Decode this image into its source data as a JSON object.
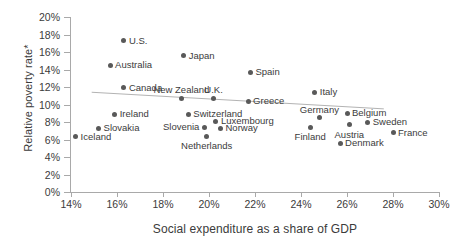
{
  "chart_data": {
    "type": "scatter",
    "title": "",
    "xlabel": "Social expenditure as a share of GDP",
    "ylabel": "Relative poverty rate*",
    "xlim": [
      14,
      30
    ],
    "ylim": [
      0,
      20
    ],
    "xticks": [
      "14%",
      "16%",
      "18%",
      "20%",
      "22%",
      "24%",
      "26%",
      "28%",
      "30%"
    ],
    "yticks": [
      "0%",
      "2%",
      "4%",
      "6%",
      "8%",
      "10%",
      "12%",
      "14%",
      "16%",
      "18%",
      "20%"
    ],
    "grid": false,
    "legend": false,
    "trendline": {
      "type": "linear",
      "x_start": 14.9,
      "y_start": 11.4,
      "x_end": 27.6,
      "y_end": 9.5
    },
    "points": [
      {
        "label": "U.S.",
        "x": 16.3,
        "y": 17.3,
        "label_pos": "right"
      },
      {
        "label": "Japan",
        "x": 18.9,
        "y": 15.6,
        "label_pos": "right"
      },
      {
        "label": "Australia",
        "x": 15.7,
        "y": 14.5,
        "label_pos": "right"
      },
      {
        "label": "Spain",
        "x": 21.8,
        "y": 13.7,
        "label_pos": "right"
      },
      {
        "label": "Canada",
        "x": 16.3,
        "y": 11.9,
        "label_pos": "right"
      },
      {
        "label": "Italy",
        "x": 24.6,
        "y": 11.4,
        "label_pos": "right"
      },
      {
        "label": "New Zealand",
        "x": 18.8,
        "y": 10.7,
        "label_pos": "above"
      },
      {
        "label": "U.K.",
        "x": 20.2,
        "y": 10.7,
        "label_pos": "above"
      },
      {
        "label": "Greece",
        "x": 21.7,
        "y": 10.4,
        "label_pos": "right"
      },
      {
        "label": "Switzerland",
        "x": 19.1,
        "y": 8.9,
        "label_pos": "right"
      },
      {
        "label": "Ireland",
        "x": 15.9,
        "y": 8.9,
        "label_pos": "right"
      },
      {
        "label": "Germany",
        "x": 24.8,
        "y": 8.5,
        "label_pos": "above"
      },
      {
        "label": "Belgium",
        "x": 26.0,
        "y": 9.0,
        "label_pos": "right"
      },
      {
        "label": "Luxembourg",
        "x": 20.3,
        "y": 8.1,
        "label_pos": "right"
      },
      {
        "label": "Sweden",
        "x": 26.9,
        "y": 8.0,
        "label_pos": "right"
      },
      {
        "label": "Austria",
        "x": 26.1,
        "y": 7.7,
        "label_pos": "below"
      },
      {
        "label": "Slovenia",
        "x": 19.8,
        "y": 7.4,
        "label_pos": "left"
      },
      {
        "label": "Norway",
        "x": 20.5,
        "y": 7.3,
        "label_pos": "right"
      },
      {
        "label": "Finland",
        "x": 24.4,
        "y": 7.4,
        "label_pos": "below"
      },
      {
        "label": "Slovakia",
        "x": 15.2,
        "y": 7.3,
        "label_pos": "right"
      },
      {
        "label": "Netherlands",
        "x": 19.9,
        "y": 6.4,
        "label_pos": "below"
      },
      {
        "label": "France",
        "x": 28.0,
        "y": 6.8,
        "label_pos": "right"
      },
      {
        "label": "Denmark",
        "x": 25.7,
        "y": 5.6,
        "label_pos": "right"
      },
      {
        "label": "Iceland",
        "x": 14.2,
        "y": 6.3,
        "label_pos": "right"
      }
    ]
  }
}
